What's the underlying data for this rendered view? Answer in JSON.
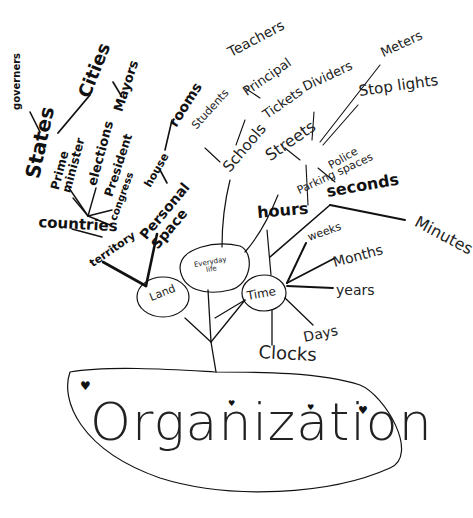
{
  "diagram": {
    "type": "mind-map",
    "style": "hand-drawn",
    "root": {
      "label": "Organization"
    },
    "hubs": [
      {
        "id": "land",
        "label": "Land"
      },
      {
        "id": "everyday",
        "label": "Everyday life"
      },
      {
        "id": "time",
        "label": "Time"
      }
    ],
    "nodes": {
      "governers": "governers",
      "cities": "Cities",
      "mayors": "Mayors",
      "states": "States",
      "prime_minister": "Prime minister",
      "elections": "elections",
      "president": "President",
      "congress": "congress",
      "countries": "countries",
      "territory": "territory",
      "rooms": "rooms",
      "house": "house",
      "personal_space": "Personal Space",
      "teachers": "Teachers",
      "principal": "Principal",
      "students": "Students",
      "schools": "Schools",
      "tickets": "Tickets",
      "dividers": "Dividers",
      "meters": "Meters",
      "stop_lights": "Stop lights",
      "streets": "Streets",
      "police": "Police",
      "parking_spaces": "Parking spaces",
      "hours": "hours",
      "seconds": "seconds",
      "minutes": "Minutes",
      "weeks": "weeks",
      "months": "Months",
      "years": "years",
      "days": "Days",
      "clocks": "Clocks"
    },
    "edges": [
      [
        "Organization",
        "trunk"
      ],
      [
        "trunk",
        "Land"
      ],
      [
        "trunk",
        "Time"
      ],
      [
        "trunk",
        "Everyday life"
      ],
      [
        "Land",
        "territory"
      ],
      [
        "Land",
        "Personal Space"
      ],
      [
        "territory",
        "countries"
      ],
      [
        "countries",
        "States"
      ],
      [
        "countries",
        "Prime minister"
      ],
      [
        "countries",
        "elections"
      ],
      [
        "countries",
        "President"
      ],
      [
        "countries",
        "congress"
      ],
      [
        "States",
        "governers"
      ],
      [
        "States",
        "Cities"
      ],
      [
        "Cities",
        "Mayors"
      ],
      [
        "Personal Space",
        "house"
      ],
      [
        "house",
        "rooms"
      ],
      [
        "Everyday life",
        "Schools"
      ],
      [
        "Schools",
        "Students"
      ],
      [
        "Schools",
        "Principal"
      ],
      [
        "Principal",
        "Teachers"
      ],
      [
        "Everyday life",
        "Streets"
      ],
      [
        "Streets",
        "Tickets"
      ],
      [
        "Streets",
        "Dividers"
      ],
      [
        "Streets",
        "Meters"
      ],
      [
        "Streets",
        "Stop lights"
      ],
      [
        "Streets",
        "Police"
      ],
      [
        "Streets",
        "Parking spaces"
      ],
      [
        "Time",
        "hours"
      ],
      [
        "Time",
        "seconds"
      ],
      [
        "seconds",
        "Minutes"
      ],
      [
        "Time",
        "weeks"
      ],
      [
        "Time",
        "Months"
      ],
      [
        "Time",
        "years"
      ],
      [
        "Time",
        "Days"
      ],
      [
        "Time",
        "Clocks"
      ]
    ],
    "decorations": {
      "hearts": 4,
      "heart_glyph": "♥"
    },
    "colors": {
      "ink": "#111111",
      "background": "#ffffff"
    }
  }
}
